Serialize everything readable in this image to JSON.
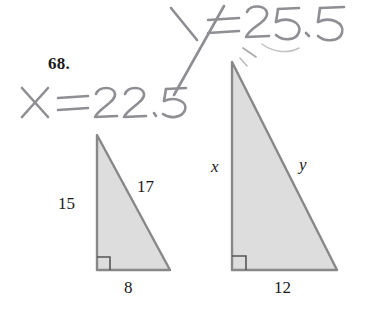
{
  "page": {
    "background_color": "#ffffff",
    "problem_number": "68."
  },
  "handwriting": {
    "color": "#8e8e93",
    "annotations": [
      {
        "name": "x-answer",
        "text": "X = 22.5",
        "value": "22.5",
        "variable": "x"
      },
      {
        "name": "y-answer",
        "text": "Y = 25.5",
        "value": "25.5",
        "variable": "y"
      }
    ]
  },
  "figure": {
    "fill_color": "#dddddd",
    "stroke_color": "#808080",
    "triangles": [
      {
        "name": "small-triangle",
        "vertices": {
          "apex": [
            97,
            135
          ],
          "right_angle": [
            97,
            270
          ],
          "base_end": [
            170,
            270
          ]
        },
        "right_angle_marker": true,
        "labels": {
          "vertical_leg": "15",
          "hypotenuse": "17",
          "base": "8"
        }
      },
      {
        "name": "large-triangle",
        "vertices": {
          "apex": [
            232,
            62
          ],
          "right_angle": [
            232,
            270
          ],
          "base_end": [
            337,
            270
          ]
        },
        "right_angle_marker": true,
        "labels": {
          "vertical_leg": "x",
          "hypotenuse": "y",
          "base": "12"
        }
      }
    ]
  }
}
